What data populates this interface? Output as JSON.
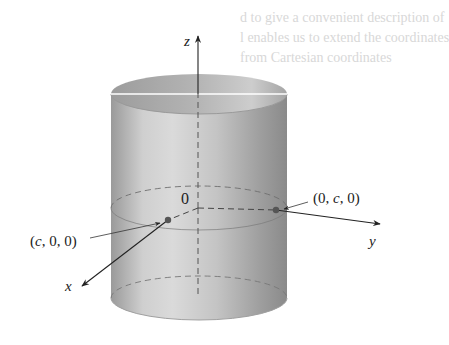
{
  "figure": {
    "axes": {
      "z_label": "z",
      "y_label": "y",
      "x_label": "x"
    },
    "origin_label": "0",
    "points": [
      {
        "label": "(c, 0, 0)",
        "axis": "x"
      },
      {
        "label": "(0, c, 0)",
        "axis": "y"
      }
    ],
    "colors": {
      "cylinder_dark": "#8f8f8f",
      "cylinder_light": "#d4d4d4",
      "axis": "#222222",
      "background": "#ffffff"
    }
  },
  "bleed_through_text": [
    "d to give a convenient description of",
    "l enables us to extend the coordinates",
    "from Cartesian coordinates"
  ]
}
